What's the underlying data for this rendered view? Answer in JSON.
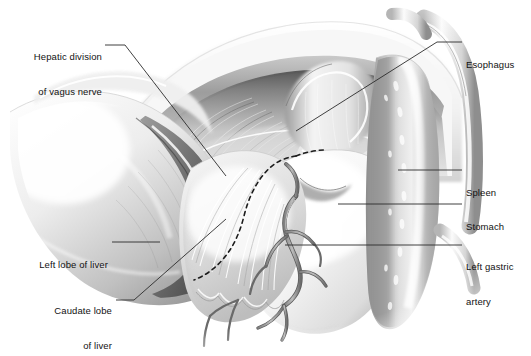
{
  "figure": {
    "type": "anatomical-illustration",
    "style": "grayscale-airbrush-medical-drawing",
    "background_color": "#ffffff",
    "label_color": "#121212",
    "leader_color": "#2b2b2b",
    "dissection_line_style": "dashed"
  },
  "labels": [
    {
      "id": "hepatic-division-of-vagus-nerve",
      "line1": "Hepatic division",
      "line2": "of vagus nerve",
      "align": "right",
      "x": 6,
      "y": 28,
      "width": 96,
      "leader": [
        [
          105,
          45
        ],
        [
          125,
          45
        ],
        [
          226,
          176
        ]
      ]
    },
    {
      "id": "esophagus",
      "line1": "Esophagus",
      "line2": "",
      "align": "left",
      "x": 466,
      "y": 36,
      "width": 62,
      "leader": [
        [
          462,
          42
        ],
        [
          437,
          42
        ],
        [
          296,
          131
        ]
      ]
    },
    {
      "id": "spleen",
      "line1": "Spleen",
      "line2": "",
      "align": "left",
      "x": 466,
      "y": 164,
      "width": 62,
      "leader": [
        [
          462,
          170
        ],
        [
          398,
          170
        ]
      ]
    },
    {
      "id": "stomach",
      "line1": "Stomach",
      "line2": "",
      "align": "left",
      "x": 466,
      "y": 198,
      "width": 62,
      "leader": [
        [
          462,
          204
        ],
        [
          338,
          204
        ]
      ]
    },
    {
      "id": "left-gastric-artery",
      "line1": "Left gastric",
      "line2": "artery",
      "align": "left",
      "x": 466,
      "y": 238,
      "width": 64,
      "leader": [
        [
          462,
          245
        ],
        [
          285,
          245
        ]
      ]
    },
    {
      "id": "left-lobe-of-liver",
      "line1": "Left lobe of liver",
      "line2": "",
      "align": "right",
      "x": 12,
      "y": 236,
      "width": 96,
      "leader": [
        [
          112,
          242
        ],
        [
          160,
          242
        ]
      ]
    },
    {
      "id": "caudate-lobe-of-liver",
      "line1": "Caudate lobe",
      "line2": "of liver",
      "align": "right",
      "x": 28,
      "y": 282,
      "width": 84,
      "leader": [
        [
          116,
          300
        ],
        [
          134,
          300
        ],
        [
          226,
          219
        ]
      ]
    }
  ]
}
